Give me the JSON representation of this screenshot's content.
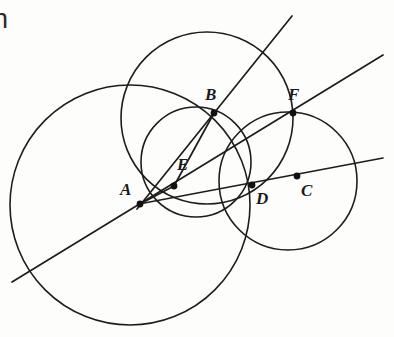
{
  "figure": {
    "background_color": "#fdfdfc",
    "stroke_color": "#1d1d1d",
    "canvas": {
      "width": 394,
      "height": 337
    },
    "clipped_text_fragment": "n"
  },
  "labels": {
    "A": "A",
    "B": "B",
    "C": "C",
    "D": "D",
    "E": "E",
    "F": "F"
  },
  "points": [
    {
      "id": "A",
      "label": "A",
      "x": 140,
      "y": 204,
      "dot": true,
      "label_x": 120,
      "label_y": 181
    },
    {
      "id": "B",
      "label": "B",
      "x": 214,
      "y": 113,
      "dot": true,
      "label_x": 205,
      "label_y": 86
    },
    {
      "id": "C",
      "label": "C",
      "x": 297,
      "y": 176,
      "dot": true,
      "label_x": 301,
      "label_y": 182
    },
    {
      "id": "D",
      "label": "D",
      "x": 252,
      "y": 185,
      "dot": true,
      "label_x": 256,
      "label_y": 190
    },
    {
      "id": "E",
      "label": "E",
      "x": 174,
      "y": 186,
      "dot": true,
      "label_x": 177,
      "label_y": 156
    },
    {
      "id": "F",
      "label": "F",
      "x": 293,
      "y": 113,
      "dot": true,
      "label_x": 288,
      "label_y": 86
    }
  ],
  "circles": [
    {
      "id": "circle-A-large",
      "cx": 130,
      "cy": 205,
      "r": 120
    },
    {
      "id": "circle-B-middle",
      "cx": 207,
      "cy": 118,
      "r": 86
    },
    {
      "id": "circle-C-right",
      "cx": 288,
      "cy": 181,
      "r": 69
    },
    {
      "id": "circle-small-AE",
      "cx": 196,
      "cy": 162,
      "r": 55
    }
  ],
  "rays": [
    {
      "id": "ray-A-through-B",
      "x1": 137,
      "y1": 209,
      "x2": 292,
      "y2": 16
    },
    {
      "id": "ray-A-through-F",
      "x1": 12,
      "y1": 282,
      "x2": 383,
      "y2": 55
    },
    {
      "id": "ray-A-through-D-C",
      "x1": 139,
      "y1": 204,
      "x2": 383,
      "y2": 158
    },
    {
      "id": "chord-E-to-B",
      "x1": 174,
      "y1": 186,
      "x2": 214,
      "y2": 113
    },
    {
      "id": "chord-A-to-E",
      "x1": 140,
      "y1": 204,
      "x2": 174,
      "y2": 186
    }
  ],
  "colors": {
    "ink": "#1d1d1d",
    "paper": "#fdfdfc"
  }
}
